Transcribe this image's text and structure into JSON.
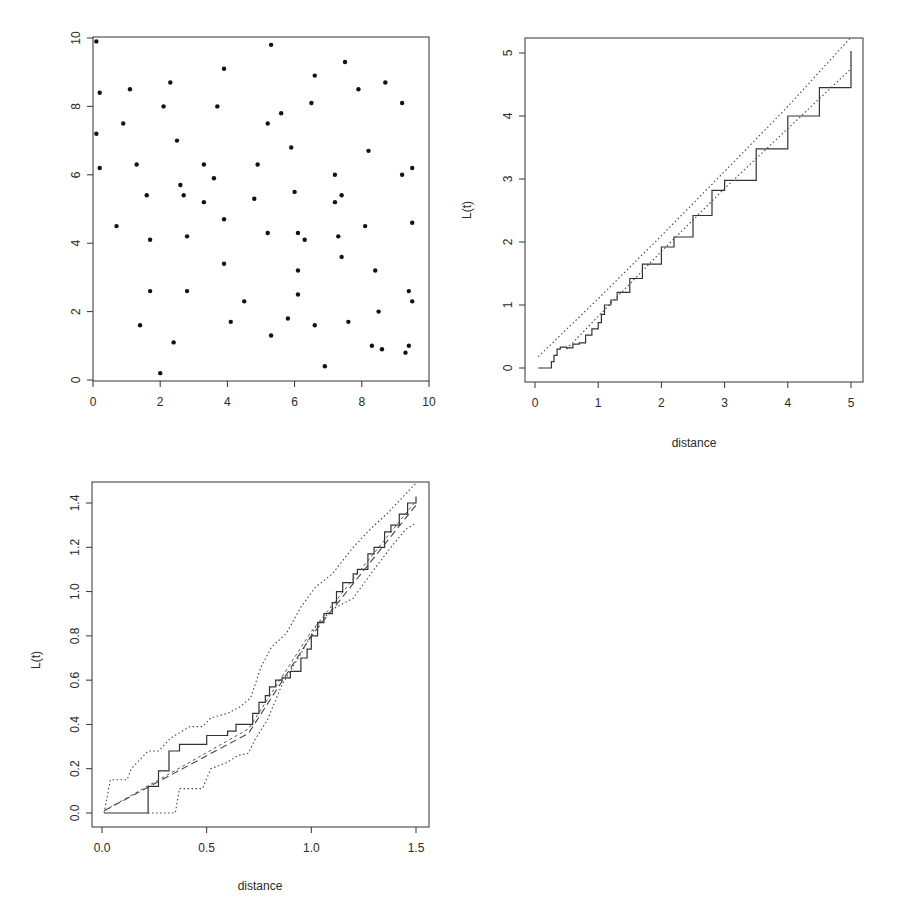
{
  "chart_data": [
    {
      "id": "scatter",
      "type": "scatter",
      "title": "",
      "xlabel": "",
      "ylabel": "",
      "xlim": [
        0,
        10
      ],
      "ylim": [
        0,
        10
      ],
      "xticks": [
        "0",
        "2",
        "4",
        "6",
        "8",
        "10"
      ],
      "xtick_values": [
        0,
        2,
        4,
        6,
        8,
        10
      ],
      "yticks": [
        "0",
        "2",
        "4",
        "6",
        "8",
        "10"
      ],
      "ytick_values": [
        0,
        2,
        4,
        6,
        8,
        10
      ],
      "grid": false,
      "points": [
        [
          0.1,
          9.9
        ],
        [
          0.2,
          8.4
        ],
        [
          0.1,
          7.2
        ],
        [
          0.2,
          6.2
        ],
        [
          0.7,
          4.5
        ],
        [
          0.9,
          7.5
        ],
        [
          1.1,
          8.5
        ],
        [
          1.3,
          6.3
        ],
        [
          1.4,
          1.6
        ],
        [
          1.6,
          5.4
        ],
        [
          1.7,
          4.1
        ],
        [
          1.7,
          2.6
        ],
        [
          2.0,
          0.2
        ],
        [
          2.1,
          8.0
        ],
        [
          2.3,
          8.7
        ],
        [
          2.4,
          1.1
        ],
        [
          2.5,
          7.0
        ],
        [
          2.6,
          5.7
        ],
        [
          2.7,
          5.4
        ],
        [
          2.8,
          4.2
        ],
        [
          2.8,
          2.6
        ],
        [
          3.3,
          6.3
        ],
        [
          3.3,
          5.2
        ],
        [
          3.6,
          5.9
        ],
        [
          3.7,
          8.0
        ],
        [
          3.9,
          9.1
        ],
        [
          3.9,
          4.7
        ],
        [
          3.9,
          3.4
        ],
        [
          4.1,
          1.7
        ],
        [
          4.5,
          2.3
        ],
        [
          4.8,
          5.3
        ],
        [
          4.9,
          6.3
        ],
        [
          5.2,
          7.5
        ],
        [
          5.2,
          4.3
        ],
        [
          5.3,
          9.8
        ],
        [
          5.3,
          1.3
        ],
        [
          5.6,
          7.8
        ],
        [
          5.8,
          1.8
        ],
        [
          5.9,
          6.8
        ],
        [
          6.0,
          5.5
        ],
        [
          6.1,
          4.3
        ],
        [
          6.1,
          3.2
        ],
        [
          6.1,
          2.5
        ],
        [
          6.3,
          4.1
        ],
        [
          6.5,
          8.1
        ],
        [
          6.6,
          8.9
        ],
        [
          6.6,
          1.6
        ],
        [
          6.9,
          0.4
        ],
        [
          7.2,
          6.0
        ],
        [
          7.2,
          5.2
        ],
        [
          7.3,
          4.2
        ],
        [
          7.4,
          5.4
        ],
        [
          7.4,
          3.6
        ],
        [
          7.5,
          9.3
        ],
        [
          7.6,
          1.7
        ],
        [
          7.9,
          8.5
        ],
        [
          8.1,
          4.5
        ],
        [
          8.2,
          6.7
        ],
        [
          8.3,
          1.0
        ],
        [
          8.4,
          3.2
        ],
        [
          8.5,
          2.0
        ],
        [
          8.6,
          0.9
        ],
        [
          8.7,
          8.7
        ],
        [
          9.2,
          8.1
        ],
        [
          9.2,
          6.0
        ],
        [
          9.3,
          0.8
        ],
        [
          9.4,
          2.6
        ],
        [
          9.4,
          1.0
        ],
        [
          9.5,
          6.2
        ],
        [
          9.5,
          4.6
        ],
        [
          9.5,
          2.3
        ]
      ]
    },
    {
      "id": "l-function-full",
      "type": "line",
      "title": "",
      "xlabel": "distance",
      "ylabel": "L(t)",
      "xlim": [
        0,
        5
      ],
      "ylim": [
        0,
        5
      ],
      "xticks": [
        "0",
        "1",
        "2",
        "3",
        "4",
        "5"
      ],
      "xtick_values": [
        0,
        1,
        2,
        3,
        4,
        5
      ],
      "yticks": [
        "0",
        "1",
        "2",
        "3",
        "4",
        "5"
      ],
      "ytick_values": [
        0,
        1,
        2,
        3,
        4,
        5
      ],
      "grid": false,
      "series": [
        {
          "name": "observed L(t)",
          "style": "solid-step",
          "x": [
            0.05,
            0.24,
            0.26,
            0.3,
            0.35,
            0.4,
            0.5,
            0.6,
            0.7,
            0.8,
            0.9,
            1.0,
            1.05,
            1.1,
            1.2,
            1.3,
            1.5,
            1.7,
            2.0,
            2.2,
            2.5,
            2.8,
            3.0,
            3.5,
            4.0,
            4.5,
            5.0
          ],
          "y": [
            0.0,
            0.0,
            0.1,
            0.2,
            0.3,
            0.33,
            0.32,
            0.38,
            0.4,
            0.52,
            0.62,
            0.72,
            0.85,
            1.0,
            1.08,
            1.2,
            1.42,
            1.65,
            1.92,
            2.08,
            2.42,
            2.82,
            2.98,
            3.48,
            4.0,
            4.45,
            5.03
          ]
        },
        {
          "name": "upper envelope",
          "style": "dotted",
          "x": [
            0.05,
            1.0,
            2.0,
            3.0,
            4.0,
            5.0
          ],
          "y": [
            0.18,
            1.1,
            2.1,
            3.12,
            4.15,
            5.25
          ]
        },
        {
          "name": "lower envelope",
          "style": "dotted",
          "x": [
            0.5,
            1.0,
            2.0,
            3.0,
            4.0,
            5.0
          ],
          "y": [
            0.3,
            0.82,
            1.85,
            2.85,
            3.8,
            4.75
          ]
        }
      ]
    },
    {
      "id": "l-function-zoom",
      "type": "line",
      "title": "",
      "xlabel": "distance",
      "ylabel": "L(t)",
      "xlim": [
        0,
        1.5
      ],
      "ylim": [
        0,
        1.4
      ],
      "xticks": [
        "0.0",
        "0.5",
        "1.0",
        "1.5"
      ],
      "xtick_values": [
        0,
        0.5,
        1.0,
        1.5
      ],
      "yticks": [
        "0.0",
        "0.2",
        "0.4",
        "0.6",
        "0.8",
        "1.0",
        "1.2",
        "1.4"
      ],
      "ytick_values": [
        0,
        0.2,
        0.4,
        0.6,
        0.8,
        1.0,
        1.2,
        1.4
      ],
      "grid": false,
      "series": [
        {
          "name": "observed L(t)",
          "style": "solid-step",
          "x": [
            0.01,
            0.22,
            0.22,
            0.27,
            0.27,
            0.32,
            0.32,
            0.37,
            0.37,
            0.5,
            0.5,
            0.6,
            0.6,
            0.64,
            0.64,
            0.7,
            0.72,
            0.75,
            0.78,
            0.8,
            0.83,
            0.86,
            0.9,
            0.95,
            0.98,
            1.0,
            1.03,
            1.06,
            1.1,
            1.12,
            1.15,
            1.2,
            1.22,
            1.27,
            1.3,
            1.35,
            1.38,
            1.42,
            1.46,
            1.5
          ],
          "y": [
            0.0,
            0.0,
            0.12,
            0.12,
            0.19,
            0.19,
            0.28,
            0.28,
            0.31,
            0.31,
            0.35,
            0.35,
            0.37,
            0.37,
            0.4,
            0.4,
            0.45,
            0.5,
            0.53,
            0.57,
            0.6,
            0.61,
            0.64,
            0.7,
            0.74,
            0.8,
            0.86,
            0.9,
            0.95,
            1.0,
            1.04,
            1.08,
            1.1,
            1.17,
            1.2,
            1.27,
            1.3,
            1.35,
            1.4,
            1.43
          ]
        },
        {
          "name": "theoretical",
          "style": "long-dash",
          "x": [
            0.01,
            0.7,
            1.0,
            1.5
          ],
          "y": [
            0.01,
            0.36,
            0.8,
            1.39
          ]
        },
        {
          "name": "reference",
          "style": "short-dash",
          "x": [
            0.01,
            0.7,
            1.0,
            1.5
          ],
          "y": [
            0.01,
            0.38,
            0.82,
            1.41
          ]
        },
        {
          "name": "upper envelope",
          "style": "dotted",
          "x": [
            0.01,
            0.04,
            0.12,
            0.14,
            0.22,
            0.27,
            0.33,
            0.42,
            0.48,
            0.52,
            0.6,
            0.66,
            0.71,
            0.76,
            0.81,
            0.88,
            0.95,
            1.02,
            1.1,
            1.2,
            1.28,
            1.37,
            1.45,
            1.5
          ],
          "y": [
            0.0,
            0.15,
            0.15,
            0.2,
            0.28,
            0.28,
            0.34,
            0.39,
            0.39,
            0.43,
            0.45,
            0.48,
            0.52,
            0.66,
            0.75,
            0.81,
            0.93,
            1.02,
            1.08,
            1.2,
            1.28,
            1.36,
            1.44,
            1.49
          ]
        },
        {
          "name": "lower envelope",
          "style": "dotted",
          "x": [
            0.22,
            0.35,
            0.37,
            0.48,
            0.52,
            0.6,
            0.65,
            0.7,
            0.73,
            0.79,
            0.86,
            0.95,
            1.02,
            1.1,
            1.2,
            1.3,
            1.38,
            1.45,
            1.5
          ],
          "y": [
            0.0,
            0.0,
            0.11,
            0.11,
            0.2,
            0.23,
            0.26,
            0.27,
            0.33,
            0.42,
            0.58,
            0.72,
            0.84,
            0.92,
            0.97,
            1.1,
            1.2,
            1.28,
            1.31
          ]
        }
      ]
    }
  ]
}
